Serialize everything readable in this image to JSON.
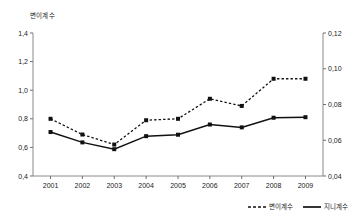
{
  "chart_data": {
    "type": "line",
    "title": "",
    "subtitle": "",
    "axis_title_top_left": "변이계수",
    "xlabel": "",
    "ylabel": "변이계수",
    "ylabel_right": "지니계수",
    "categories": [
      "2001",
      "2002",
      "2003",
      "2004",
      "2005",
      "2006",
      "2007",
      "2008",
      "2009"
    ],
    "x": [
      2001,
      2002,
      2003,
      2004,
      2005,
      2006,
      2007,
      2008,
      2009
    ],
    "ylim": [
      0.4,
      1.4
    ],
    "ylim_right": [
      0.04,
      0.12
    ],
    "yticks": [
      "0,4",
      "0,6",
      "0,8",
      "1,0",
      "1,2",
      "1,4"
    ],
    "ytick_values": [
      0.4,
      0.6,
      0.8,
      1.0,
      1.2,
      1.4
    ],
    "yticks_right": [
      "0,04",
      "0,06",
      "0,08",
      "0,10",
      "0,12"
    ],
    "ytick_values_right": [
      0.04,
      0.06,
      0.08,
      0.1,
      0.12
    ],
    "grid": false,
    "legend_position": "bottom-right",
    "series": [
      {
        "name": "변이계수",
        "axis": "left",
        "style": "dashed",
        "marker": "square",
        "values": [
          0.8,
          0.69,
          0.62,
          0.79,
          0.8,
          0.94,
          0.89,
          1.08,
          1.08
        ]
      },
      {
        "name": "지니계수",
        "axis": "right",
        "style": "solid",
        "marker": "square",
        "values": [
          0.0646,
          0.0588,
          0.055,
          0.0623,
          0.0631,
          0.0688,
          0.0672,
          0.0726,
          0.0729
        ]
      }
    ],
    "legend": [
      {
        "label": "변이계수",
        "style": "dashed"
      },
      {
        "label": "지니계수",
        "style": "solid"
      }
    ],
    "colors": {
      "series_line": "#111111",
      "axis": "#8a8a8a",
      "text": "#1a1a1a",
      "background": "#ffffff"
    }
  }
}
